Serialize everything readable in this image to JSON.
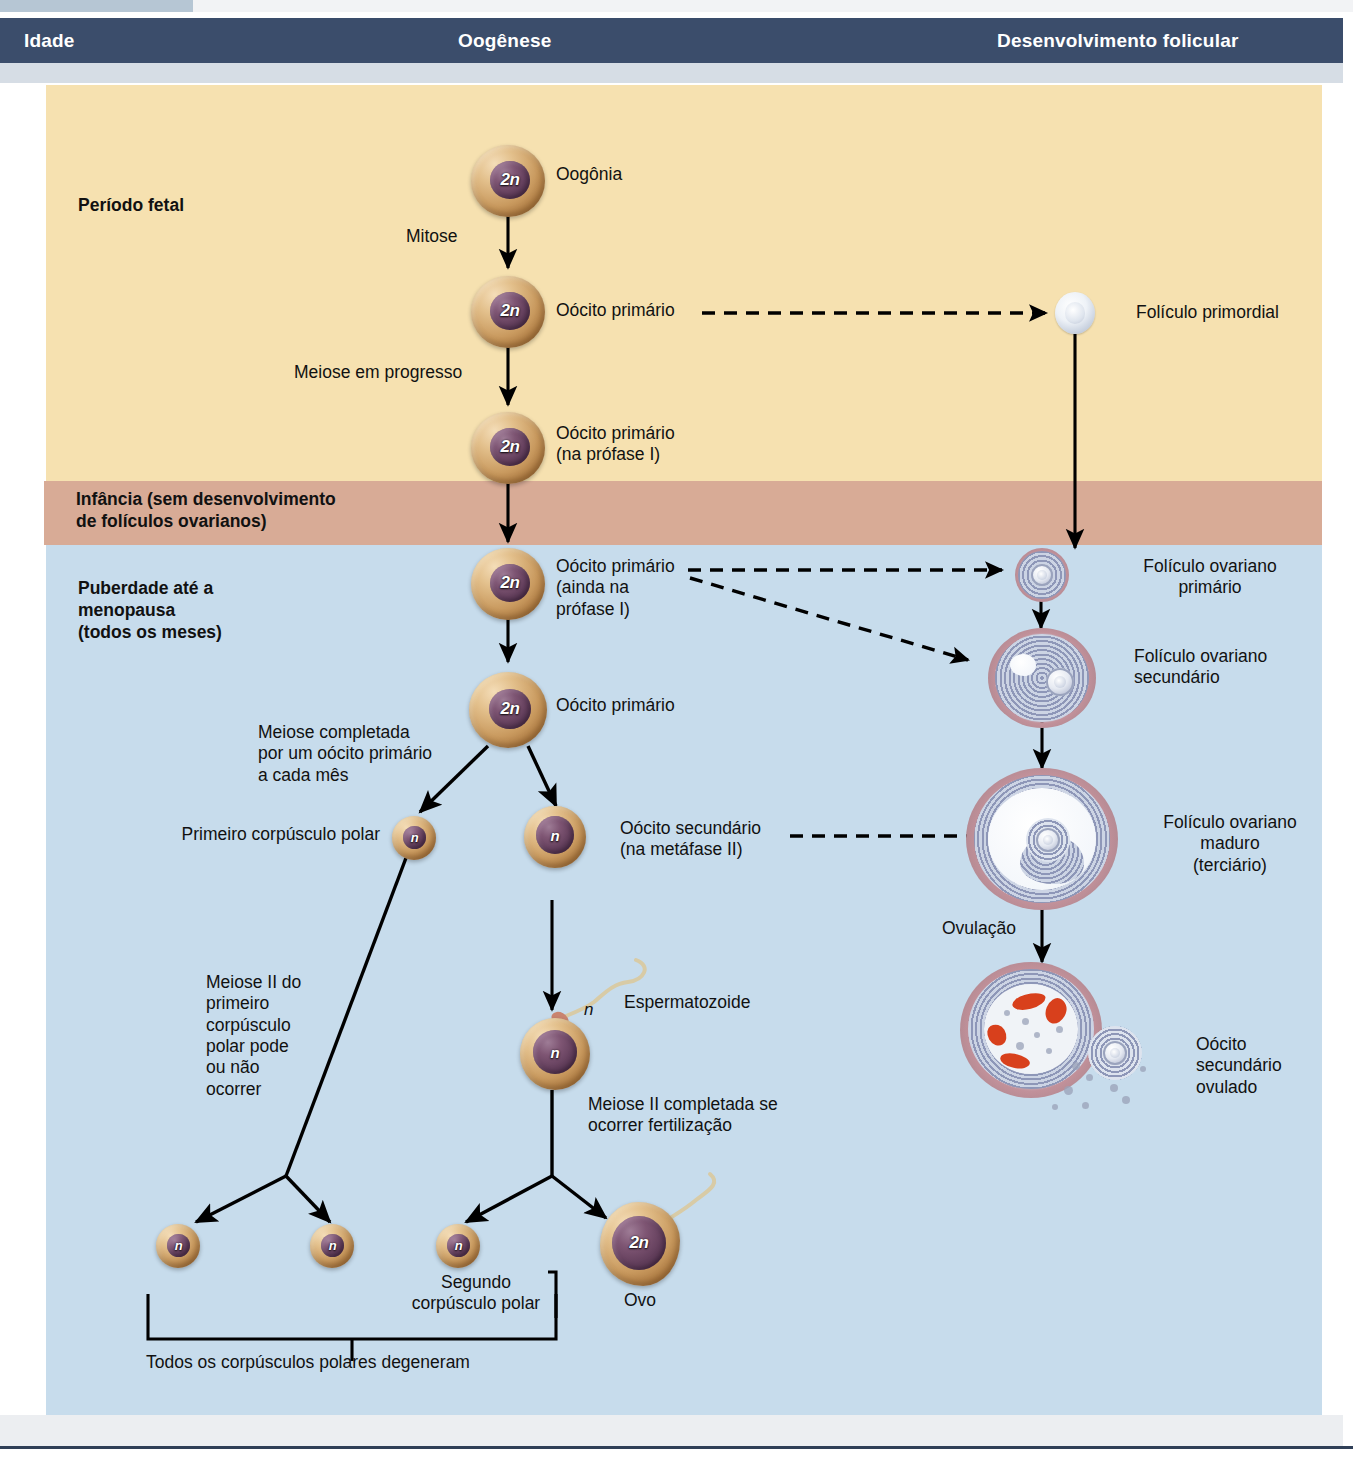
{
  "header": {
    "columns": [
      {
        "label": "Idade",
        "align": "left"
      },
      {
        "label": "Oogênese",
        "align": "center"
      },
      {
        "label": "Desenvolvimento folicular",
        "align": "center"
      }
    ]
  },
  "bands": [
    {
      "id": "fetal",
      "label": "Período fetal",
      "color": "#f6e1b0"
    },
    {
      "id": "infancia",
      "label": "Infância (sem desenvolvimento\nde folículos ovarianos)",
      "color": "#d8ab96"
    },
    {
      "id": "puberdade",
      "label": "Puberdade até a\nmenopausa\n(todos os meses)",
      "color": "#c7dcec"
    }
  ],
  "oogenesis": {
    "cells": [
      {
        "id": "oogonia",
        "ploidy": "2n",
        "label": "Oogônia"
      },
      {
        "id": "primary1",
        "ploidy": "2n",
        "label": "Oócito primário"
      },
      {
        "id": "primary2",
        "ploidy": "2n",
        "label": "Oócito primário\n(na prófase I)"
      },
      {
        "id": "primary3",
        "ploidy": "2n",
        "label": "Oócito primário\n(ainda na\nprófase I)"
      },
      {
        "id": "primary4",
        "ploidy": "2n",
        "label": "Oócito primário"
      },
      {
        "id": "polar1",
        "ploidy": "n",
        "label": "Primeiro corpúsculo polar"
      },
      {
        "id": "secondary",
        "ploidy": "n",
        "label": "Oócito secundário\n(na metáfase II)"
      },
      {
        "id": "fertilized",
        "ploidy": "n",
        "label": ""
      },
      {
        "id": "polar_a",
        "ploidy": "n",
        "label": ""
      },
      {
        "id": "polar_b",
        "ploidy": "n",
        "label": ""
      },
      {
        "id": "polar_c",
        "ploidy": "n",
        "label": "Segundo\ncorpúsculo polar"
      },
      {
        "id": "ovo",
        "ploidy": "2n",
        "label": "Ovo"
      }
    ],
    "process_labels": [
      {
        "id": "mitose",
        "text": "Mitose"
      },
      {
        "id": "meiose_prog",
        "text": "Meiose em progresso"
      },
      {
        "id": "meiose_compl",
        "text": "Meiose completada\npor um oócito primário\na cada mês"
      },
      {
        "id": "meiose2_polar",
        "text": "Meiose II do\nprimeiro\ncorpúsculo\npolar pode\nou não\nocorrer"
      },
      {
        "id": "meiose2_fert",
        "text": "Meiose II completada se\nocorrer fertilização"
      },
      {
        "id": "esperma",
        "text": "Espermatozoide"
      },
      {
        "id": "esperma_n",
        "text": "n"
      },
      {
        "id": "degeneram",
        "text": "Todos os corpúsculos polares degeneram"
      }
    ]
  },
  "follicles": {
    "items": [
      {
        "id": "primordial",
        "label": "Folículo primordial"
      },
      {
        "id": "primario",
        "label": "Folículo ovariano\nprimário"
      },
      {
        "id": "secundario",
        "label": "Folículo ovariano\nsecundário"
      },
      {
        "id": "maduro",
        "label": "Folículo ovariano\nmaduro\n(terciário)"
      },
      {
        "id": "ovulado",
        "label": "Oócito\nsecundário\novulado"
      }
    ],
    "process_labels": [
      {
        "id": "ovulacao",
        "text": "Ovulação"
      }
    ]
  },
  "colors": {
    "header_bg": "#3b4d6b",
    "header_text": "#ffffff",
    "band_fetal": "#f6e1b0",
    "band_infancia": "#d8ab96",
    "band_puberdade": "#c7dcec",
    "arrow": "#000000",
    "cytoplasm": "#c99a5f",
    "nucleus": "#7e5573",
    "granulosa": "#8e97b8",
    "theca": "#c2919a",
    "blood": "#d8401c"
  }
}
